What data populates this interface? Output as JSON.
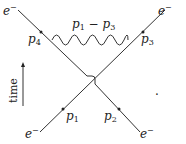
{
  "diagram": {
    "type": "feynman",
    "labels": {
      "top_left_particle": "e",
      "top_right_particle": "e",
      "bottom_left_particle": "e",
      "bottom_right_particle": "e",
      "charge": "−",
      "p4": "p",
      "p4_sub": "4",
      "p3": "p",
      "p3_sub": "3",
      "p1": "p",
      "p1_sub": "1",
      "p2": "p",
      "p2_sub": "2",
      "photon_p1": "p",
      "photon_p1_sub": "1",
      "photon_minus": " − ",
      "photon_p3": "p",
      "photon_p3_sub": "3",
      "time_axis": "time",
      "trailing_mark": "."
    },
    "colors": {
      "line": "#333333",
      "text": "#222222"
    }
  }
}
